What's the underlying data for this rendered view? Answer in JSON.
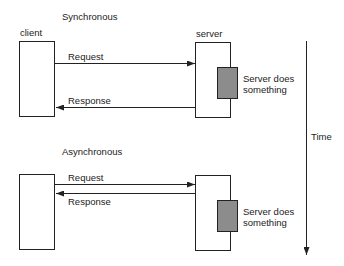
{
  "sync": {
    "title": "Synchronous",
    "client_label": "client",
    "server_label": "server",
    "request_label": "Request",
    "response_label": "Response",
    "server_work_label_1": "Server does",
    "server_work_label_2": "something"
  },
  "async": {
    "title": "Asynchronous",
    "request_label": "Request",
    "response_label": "Response",
    "server_work_label_1": "Server does",
    "server_work_label_2": "something"
  },
  "time_axis": {
    "label": "Time"
  },
  "colors": {
    "line": "#222222",
    "work_fill": "#8c8c8c"
  }
}
